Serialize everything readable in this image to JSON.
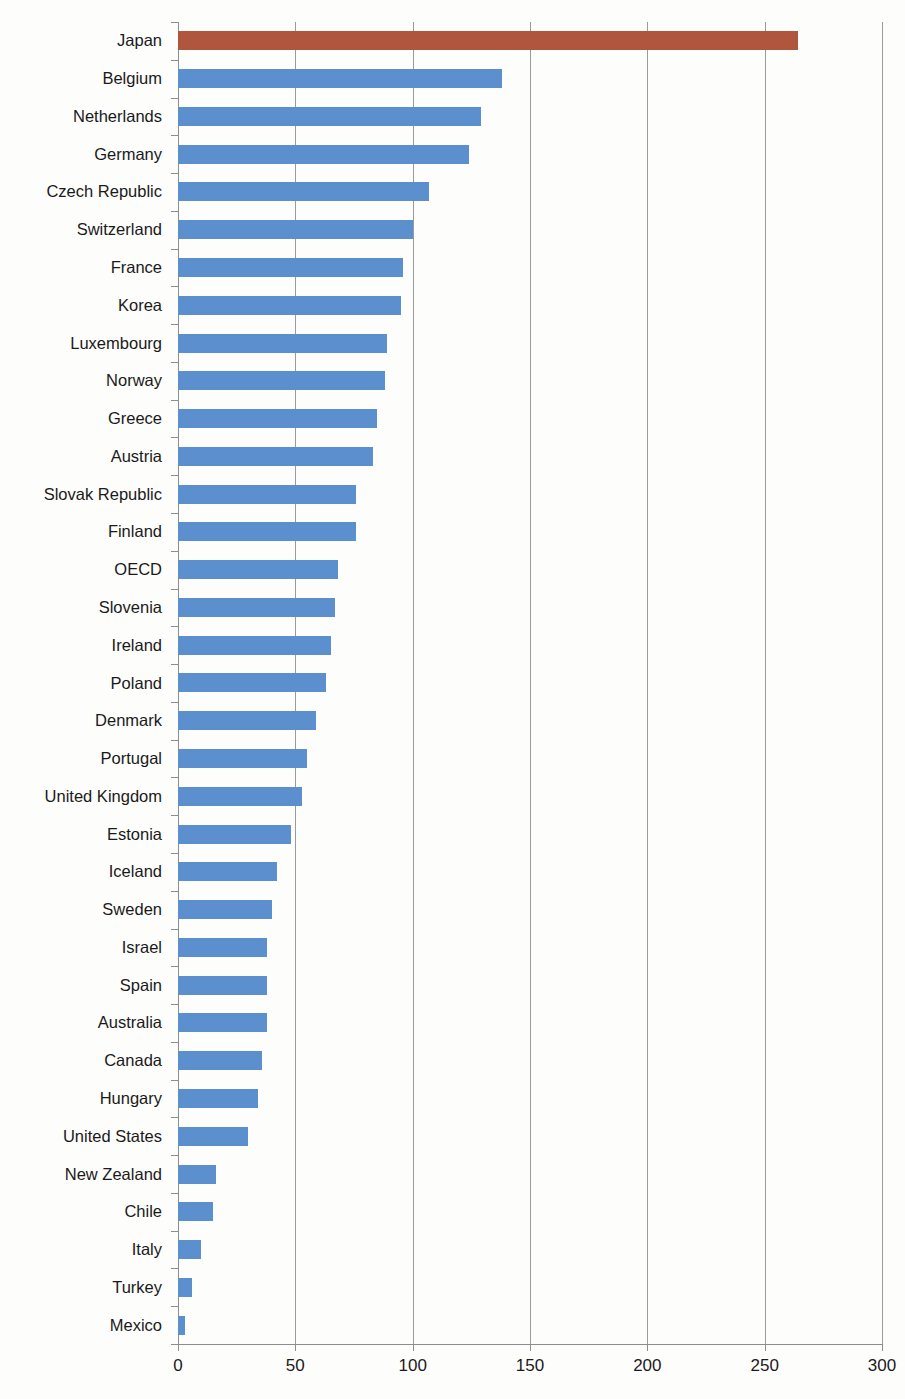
{
  "chart_data": {
    "type": "bar",
    "orientation": "horizontal",
    "title": "",
    "subtitle": "",
    "xlabel": "",
    "ylabel": "",
    "xlim": [
      0,
      300
    ],
    "ylim": null,
    "grid": "vertical",
    "legend": null,
    "xticks": [
      0,
      50,
      100,
      150,
      200,
      250,
      300
    ],
    "xtick_labels": [
      "0",
      "50",
      "100",
      "150",
      "200",
      "250",
      "300"
    ],
    "highlight_category": "Japan",
    "colors": {
      "bar": "#5b8fce",
      "highlight_bar": "#b0563c",
      "gridline": "#9a9a9a",
      "axis": "#8d8d8d",
      "text": "#1a1a1a",
      "background": "#fdfdfc"
    },
    "categories": [
      "Japan",
      "Belgium",
      "Netherlands",
      "Germany",
      "Czech Republic",
      "Switzerland",
      "France",
      "Korea",
      "Luxembourg",
      "Norway",
      "Greece",
      "Austria",
      "Slovak Republic",
      "Finland",
      "OECD",
      "Slovenia",
      "Ireland",
      "Poland",
      "Denmark",
      "Portugal",
      "United Kingdom",
      "Estonia",
      "Iceland",
      "Sweden",
      "Israel",
      "Spain",
      "Australia",
      "Canada",
      "Hungary",
      "United States",
      "New Zealand",
      "Chile",
      "Italy",
      "Turkey",
      "Mexico"
    ],
    "values": [
      264,
      138,
      129,
      124,
      107,
      100,
      96,
      95,
      89,
      88,
      85,
      83,
      76,
      76,
      68,
      67,
      65,
      63,
      59,
      55,
      53,
      48,
      42,
      40,
      38,
      38,
      38,
      36,
      34,
      30,
      16,
      15,
      10,
      6,
      3
    ]
  }
}
